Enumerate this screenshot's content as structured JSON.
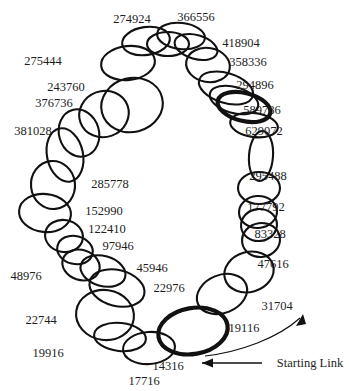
{
  "figure": {
    "type": "ring-chain-diagram",
    "background_color": "#ffffff",
    "stroke_color": "#111111"
  },
  "annotation": {
    "starting_link_label": "Starting Link",
    "starting_link_value": "14316",
    "arrow_icon_name": "arrow-left-icon",
    "curve_arrow_icon_name": "curved-arrow-up-icon"
  },
  "chart_data": {
    "type": "diagram",
    "link_count": 32,
    "highlighted_link": "14316",
    "labels": [
      "274924",
      "366556",
      "418904",
      "358336",
      "294896",
      "589786",
      "629072",
      "295488",
      "177792",
      "83328",
      "47616",
      "31704",
      "19116",
      "14316",
      "17716",
      "19916",
      "22744",
      "22976",
      "45946",
      "48976",
      "97946",
      "122410",
      "152990",
      "285778",
      "381028",
      "376736",
      "243760",
      "275444"
    ],
    "links": [
      {
        "value": "274924",
        "label_x": 132,
        "label_y": 19,
        "cx": 146,
        "cy": 41,
        "rx": 24,
        "ry": 14,
        "rot": -8,
        "thick": false
      },
      {
        "value": "366556",
        "label_x": 196,
        "label_y": 17,
        "cx": 181,
        "cy": 36,
        "rx": 24,
        "ry": 13,
        "rot": 6,
        "thick": false
      },
      {
        "value": "418904",
        "label_x": 241,
        "label_y": 43,
        "cx": 196,
        "cy": 47,
        "rx": 22,
        "ry": 12,
        "rot": 16,
        "thick": false
      },
      {
        "value": "358336",
        "label_x": 248,
        "label_y": 62,
        "cx": 208,
        "cy": 65,
        "rx": 22,
        "ry": 17,
        "rot": 10,
        "thick": false
      },
      {
        "value": "294896",
        "label_x": 255,
        "label_y": 85,
        "cx": 226,
        "cy": 88,
        "rx": 28,
        "ry": 15,
        "rot": 17,
        "thick": false
      },
      {
        "value": "589786",
        "label_x": 262,
        "label_y": 110,
        "cx": 244,
        "cy": 107,
        "rx": 27,
        "ry": 14,
        "rot": 14,
        "thick": true
      },
      {
        "value": "629072",
        "label_x": 264,
        "label_y": 131,
        "cx": 254,
        "cy": 125,
        "rx": 24,
        "ry": 12,
        "rot": 8,
        "thick": false
      },
      {
        "value": "295488",
        "label_x": 268,
        "label_y": 176,
        "cx": 261,
        "cy": 156,
        "rx": 12,
        "ry": 25,
        "rot": 4,
        "thick": false
      },
      {
        "value": "177792",
        "label_x": 266,
        "label_y": 207,
        "cx": 259,
        "cy": 188,
        "rx": 21,
        "ry": 16,
        "rot": 0,
        "thick": false
      },
      {
        "value": "83328",
        "label_x": 270,
        "label_y": 234,
        "cx": 258,
        "cy": 212,
        "rx": 19,
        "ry": 16,
        "rot": -4,
        "thick": false
      },
      {
        "value": "47616",
        "label_x": 273,
        "label_y": 264,
        "cx": 261,
        "cy": 240,
        "rx": 19,
        "ry": 17,
        "rot": -8,
        "thick": false
      },
      {
        "value": "31704",
        "label_x": 277,
        "label_y": 306,
        "cx": 249,
        "cy": 272,
        "rx": 25,
        "ry": 20,
        "rot": -16,
        "thick": false
      },
      {
        "value": "19116",
        "label_x": 244,
        "label_y": 328,
        "cx": 222,
        "cy": 294,
        "rx": 26,
        "ry": 19,
        "rot": -22,
        "thick": false
      },
      {
        "value": "14316",
        "label_x": 168,
        "label_y": 366,
        "cx": 193,
        "cy": 331,
        "rx": 35,
        "ry": 23,
        "rot": -10,
        "thick": true
      },
      {
        "value": "17716",
        "label_x": 144,
        "label_y": 381,
        "cx": 149,
        "cy": 348,
        "rx": 26,
        "ry": 16,
        "rot": -4,
        "thick": false
      },
      {
        "value": "19916",
        "label_x": 48,
        "label_y": 353,
        "cx": 120,
        "cy": 337,
        "rx": 26,
        "ry": 14,
        "rot": 6,
        "thick": false
      },
      {
        "value": "22744",
        "label_x": 41,
        "label_y": 320,
        "cx": 105,
        "cy": 315,
        "rx": 29,
        "ry": 25,
        "rot": 8,
        "thick": false
      },
      {
        "value": "22976",
        "label_x": 169,
        "label_y": 288,
        "cx": 117,
        "cy": 288,
        "rx": 28,
        "ry": 18,
        "rot": 14,
        "thick": false
      },
      {
        "value": "45946",
        "label_x": 152,
        "label_y": 268,
        "cx": 103,
        "cy": 271,
        "rx": 23,
        "ry": 15,
        "rot": 16,
        "thick": false
      },
      {
        "value": "48976",
        "label_x": 26,
        "label_y": 276,
        "cx": 81,
        "cy": 265,
        "rx": 19,
        "ry": 15,
        "rot": 18,
        "thick": false
      },
      {
        "value": "97946",
        "label_x": 118,
        "label_y": 246,
        "cx": 75,
        "cy": 250,
        "rx": 18,
        "ry": 14,
        "rot": 14,
        "thick": false
      },
      {
        "value": "122410",
        "label_x": 107,
        "label_y": 229,
        "cx": 64,
        "cy": 236,
        "rx": 19,
        "ry": 16,
        "rot": 10,
        "thick": false
      },
      {
        "value": "152990",
        "label_x": 104,
        "label_y": 211,
        "cx": 45,
        "cy": 213,
        "rx": 26,
        "ry": 19,
        "rot": 6,
        "thick": false
      },
      {
        "value": "285778",
        "label_x": 110,
        "label_y": 184,
        "cx": 53,
        "cy": 185,
        "rx": 22,
        "ry": 24,
        "rot": -6,
        "thick": false
      },
      {
        "value": "381028",
        "label_x": 33,
        "label_y": 131,
        "cx": 65,
        "cy": 155,
        "rx": 18,
        "ry": 27,
        "rot": -12,
        "thick": false
      },
      {
        "value": "376736",
        "label_x": 54,
        "label_y": 103,
        "cx": 79,
        "cy": 133,
        "rx": 20,
        "ry": 24,
        "rot": -16,
        "thick": false
      },
      {
        "value": "243760",
        "label_x": 66,
        "label_y": 87,
        "cx": 104,
        "cy": 114,
        "rx": 25,
        "ry": 23,
        "rot": -20,
        "thick": false
      },
      {
        "value": "275444",
        "label_x": 43,
        "label_y": 61,
        "cx": 132,
        "cy": 105,
        "rx": 31,
        "ry": 27,
        "rot": -14,
        "thick": false
      },
      {
        "value": "link-a",
        "label_x": -999,
        "label_y": -999,
        "cx": 128,
        "cy": 63,
        "rx": 27,
        "ry": 17,
        "rot": -6,
        "thick": false
      },
      {
        "value": "link-b",
        "label_x": -999,
        "label_y": -999,
        "cx": 168,
        "cy": 44,
        "rx": 21,
        "ry": 12,
        "rot": 0,
        "thick": false
      },
      {
        "value": "link-c",
        "label_x": -999,
        "label_y": -999,
        "cx": 234,
        "cy": 100,
        "rx": 25,
        "ry": 13,
        "rot": 16,
        "thick": false
      },
      {
        "value": "link-d",
        "label_x": -999,
        "label_y": -999,
        "cx": 259,
        "cy": 225,
        "rx": 18,
        "ry": 16,
        "rot": -6,
        "thick": false
      }
    ]
  }
}
